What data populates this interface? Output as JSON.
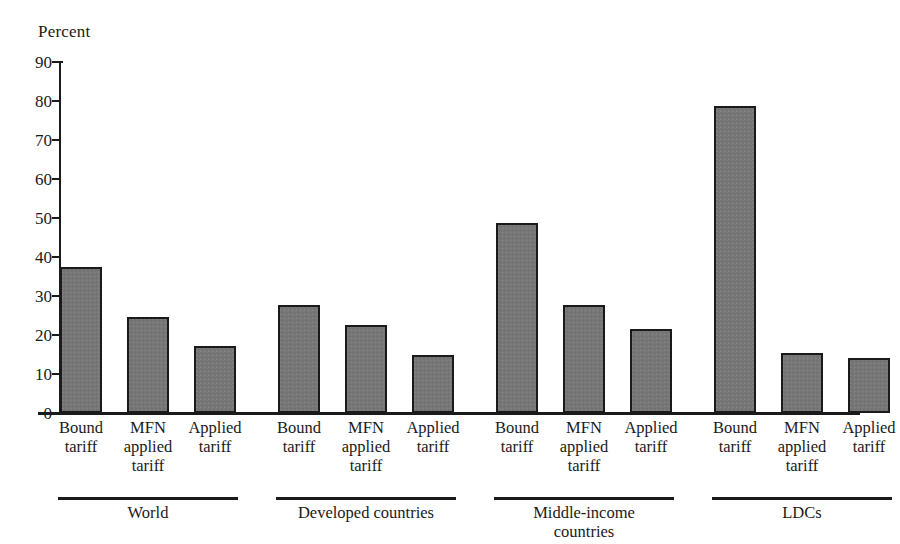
{
  "chart_data": {
    "type": "bar",
    "title": "",
    "ylabel": "Percent",
    "xlabel": "",
    "ylim": [
      0,
      90
    ],
    "ytick_step": 10,
    "grid": false,
    "legend": null,
    "yticks": [
      "90",
      "80",
      "70",
      "60",
      "50",
      "40",
      "30",
      "20",
      "10",
      "0"
    ],
    "categories": [
      "Bound tariff",
      "MFN applied tariff",
      "Applied tariff",
      "Bound tariff",
      "MFN applied tariff",
      "Applied tariff",
      "Bound tariff",
      "MFN applied tariff",
      "Applied tariff",
      "Bound tariff",
      "MFN applied tariff",
      "Applied tariff"
    ],
    "values": [
      37.5,
      24.5,
      17.3,
      27.7,
      22.6,
      14.8,
      48.7,
      27.6,
      21.6,
      78.7,
      15.3,
      14.1
    ],
    "groups": [
      {
        "label": "World",
        "members": [
          "Bound tariff",
          "MFN applied tariff",
          "Applied tariff"
        ]
      },
      {
        "label": "Developed countries",
        "members": [
          "Bound tariff",
          "MFN applied tariff",
          "Applied tariff"
        ]
      },
      {
        "label": "Middle-income countries",
        "members": [
          "Bound tariff",
          "MFN applied tariff",
          "Applied tariff"
        ]
      },
      {
        "label": "LDCs",
        "members": [
          "Bound tariff",
          "MFN applied tariff",
          "Applied tariff"
        ]
      }
    ],
    "bar_color": "#767676",
    "bar_edge_color": "#1a1a1a",
    "background_color": "#ffffff"
  },
  "tick_labels": [
    {
      "line1": "Bound",
      "line2": "tariff",
      "line3": ""
    },
    {
      "line1": "MFN",
      "line2": "applied",
      "line3": "tariff"
    },
    {
      "line1": "Applied",
      "line2": "tariff",
      "line3": ""
    },
    {
      "line1": "Bound",
      "line2": "tariff",
      "line3": ""
    },
    {
      "line1": "MFN",
      "line2": "applied",
      "line3": "tariff"
    },
    {
      "line1": "Applied",
      "line2": "tariff",
      "line3": ""
    },
    {
      "line1": "Bound",
      "line2": "tariff",
      "line3": ""
    },
    {
      "line1": "MFN",
      "line2": "applied",
      "line3": "tariff"
    },
    {
      "line1": "Applied",
      "line2": "tariff",
      "line3": ""
    },
    {
      "line1": "Bound",
      "line2": "tariff",
      "line3": ""
    },
    {
      "line1": "MFN",
      "line2": "applied",
      "line3": "tariff"
    },
    {
      "line1": "Applied",
      "line2": "tariff",
      "line3": ""
    }
  ],
  "group_labels": [
    {
      "line1": "World",
      "line2": ""
    },
    {
      "line1": "Developed countries",
      "line2": ""
    },
    {
      "line1": "Middle-income",
      "line2": "countries"
    },
    {
      "line1": "LDCs",
      "line2": ""
    }
  ]
}
